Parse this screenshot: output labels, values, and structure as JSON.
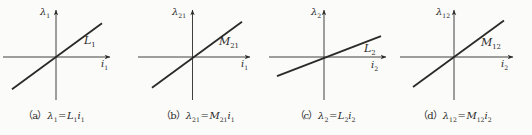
{
  "figure": {
    "colors": {
      "ink": "#2a2a28",
      "background": "#fbfbf9"
    },
    "panels": [
      {
        "id": "a",
        "y_label": {
          "base": "λ",
          "sub": "1"
        },
        "slope_label": {
          "base": "L",
          "sub": "1"
        },
        "x_label": {
          "base": "i",
          "sub": "1"
        },
        "caption": {
          "prefix": "（a）",
          "lhs": {
            "base": "λ",
            "sub": "1"
          },
          "equals": "=",
          "coef": {
            "base": "L",
            "sub": "1"
          },
          "var": {
            "base": "i",
            "sub": "1"
          }
        }
      },
      {
        "id": "b",
        "y_label": {
          "base": "λ",
          "sub": "21"
        },
        "slope_label": {
          "base": "M",
          "sub": "21"
        },
        "x_label": {
          "base": "i",
          "sub": "1"
        },
        "caption": {
          "prefix": "（b）",
          "lhs": {
            "base": "λ",
            "sub": "21"
          },
          "equals": "=",
          "coef": {
            "base": "M",
            "sub": "21"
          },
          "var": {
            "base": "i",
            "sub": "1"
          }
        }
      },
      {
        "id": "c",
        "y_label": {
          "base": "λ",
          "sub": "2"
        },
        "slope_label": {
          "base": "L",
          "sub": "2"
        },
        "x_label": {
          "base": "i",
          "sub": "2"
        },
        "caption": {
          "prefix": "（c）",
          "lhs": {
            "base": "λ",
            "sub": "2"
          },
          "equals": "=",
          "coef": {
            "base": "L",
            "sub": "2"
          },
          "var": {
            "base": "i",
            "sub": "2"
          }
        }
      },
      {
        "id": "d",
        "y_label": {
          "base": "λ",
          "sub": "12"
        },
        "slope_label": {
          "base": "M",
          "sub": "12"
        },
        "x_label": {
          "base": "i",
          "sub": "2"
        },
        "caption": {
          "prefix": "（d）",
          "lhs": {
            "base": "λ",
            "sub": "12"
          },
          "equals": "=",
          "coef": {
            "base": "M",
            "sub": "12"
          },
          "var": {
            "base": "i",
            "sub": "2"
          }
        }
      }
    ]
  }
}
